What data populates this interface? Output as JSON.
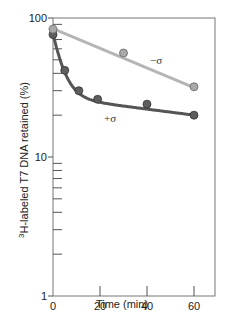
{
  "chart_data": {
    "type": "scatter",
    "title": "",
    "xlabel": "Time (min)",
    "ylabel_sup": "3",
    "ylabel": "H-labeled T7 DNA retained (%)",
    "xlim": [
      0,
      68
    ],
    "ylim": [
      1,
      100
    ],
    "yscale": "log",
    "x_ticks": [
      0,
      20,
      40,
      60
    ],
    "x_tick_labels": [
      "0",
      "20",
      "40",
      "60"
    ],
    "y_tick_labels": [
      "1",
      "10",
      "100"
    ],
    "grid": false,
    "legend": "inline labels",
    "series": [
      {
        "name": "−σ",
        "color": "#a9a9a9",
        "fit": "straight line (exponential decay)",
        "points": [
          {
            "x": 0,
            "y": 83
          },
          {
            "x": 30,
            "y": 56
          },
          {
            "x": 60,
            "y": 32
          }
        ]
      },
      {
        "name": "+σ",
        "color": "#555555",
        "fit": "biphasic curve",
        "points": [
          {
            "x": 0,
            "y": 76
          },
          {
            "x": 5,
            "y": 42
          },
          {
            "x": 11,
            "y": 30
          },
          {
            "x": 19,
            "y": 26
          },
          {
            "x": 40,
            "y": 24
          },
          {
            "x": 60,
            "y": 20
          }
        ]
      }
    ]
  }
}
